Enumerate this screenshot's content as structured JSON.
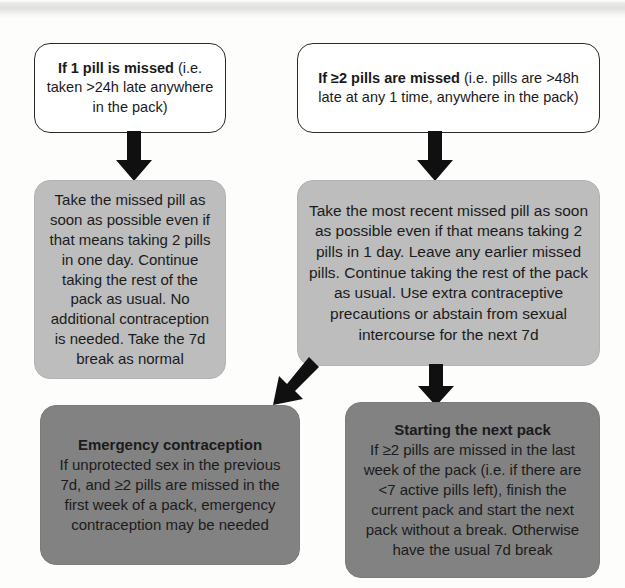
{
  "diagram": {
    "colors": {
      "outline_box_fill": "#ffffff",
      "outline_box_border": "#2b2b2b",
      "grey_box_fill": "#bdbdbd",
      "dark_box_fill": "#828282",
      "arrow_fill": "#101010",
      "text": "#1a1a1a",
      "page_background": "#fdfdfc"
    },
    "nodes": {
      "missed_one_pill": {
        "lead": "If 1 pill is missed",
        "rest": " (i.e. taken >24h late anywhere in the pack)",
        "style": "outline"
      },
      "missed_two_pills": {
        "lead": "If ≥2 pills are missed",
        "rest": " (i.e. pills are >48h late at any 1 time, anywhere in the pack)",
        "style": "outline"
      },
      "action_one_pill": {
        "text": "Take the missed pill as soon as possible even if that means taking 2 pills in one day. Continue taking the rest of the pack as usual. No additional contraception is needed. Take the 7d break as normal",
        "style": "grey"
      },
      "action_two_pills": {
        "text": "Take the most recent missed pill as soon as possible even if that means taking 2 pills in 1 day. Leave any earlier missed pills. Continue taking the rest of the pack as usual. Use extra contraceptive precautions or abstain from sexual intercourse for the next 7d",
        "style": "grey"
      },
      "emergency_contraception": {
        "lead": "Emergency contraception",
        "rest": "If unprotected sex in the previous 7d, and ≥2 pills are missed in the first week of a pack, emergency contraception may be needed",
        "style": "dark"
      },
      "starting_next_pack": {
        "lead": "Starting the next pack",
        "rest": "If ≥2 pills are missed in the last week of the pack (i.e. if there are <7 active pills left), finish the current pack and start the next pack without a break. Otherwise have the usual 7d break",
        "style": "dark"
      }
    },
    "arrows": [
      {
        "name": "arrow-missed-one-to-action-one",
        "from": "missed_one_pill",
        "to": "action_one_pill",
        "direction": "down"
      },
      {
        "name": "arrow-missed-two-to-action-two",
        "from": "missed_two_pills",
        "to": "action_two_pills",
        "direction": "down"
      },
      {
        "name": "arrow-action-two-to-emergency",
        "from": "action_two_pills",
        "to": "emergency_contraception",
        "direction": "down-left"
      },
      {
        "name": "arrow-action-two-to-next-pack",
        "from": "action_two_pills",
        "to": "starting_next_pack",
        "direction": "down"
      }
    ]
  }
}
